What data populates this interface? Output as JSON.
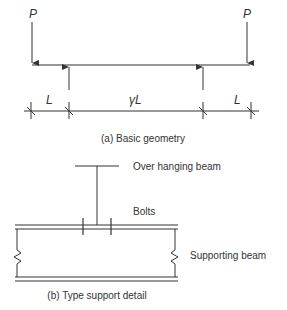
{
  "figure_a": {
    "load_left": "P",
    "load_right": "P",
    "dim_left": "L",
    "dim_middle": "γL",
    "dim_right": "L",
    "caption": "(a) Basic geometry"
  },
  "figure_b": {
    "label_overhanging": "Over hanging beam",
    "label_bolts": "Bolts",
    "label_supporting": "Supporting beam",
    "caption": "(b) Type support detail"
  },
  "colors": {
    "line": "#333333",
    "background": "#ffffff"
  }
}
